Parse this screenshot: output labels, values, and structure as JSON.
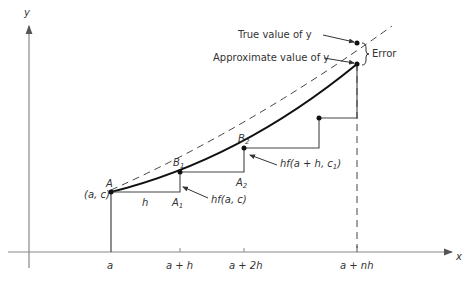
{
  "diagram": {
    "axes": {
      "x_label": "x",
      "y_label": "y"
    },
    "x_ticks": [
      "a",
      "a + h",
      "a + 2h",
      "a + nh"
    ],
    "points": {
      "A": "A",
      "A_coord": "(a, c)",
      "B1": "B",
      "B1_sub": "1",
      "B2": "B",
      "B2_sub": "2",
      "A1": "A",
      "A1_sub": "1",
      "A2": "A",
      "A2_sub": "2"
    },
    "labels": {
      "step": "h",
      "hf1": "hf(a, c)",
      "hf2_prefix": "hf(a + h, c",
      "hf2_sub": "1",
      "hf2_suffix": ")",
      "true_value": "True value of y",
      "approx_value": "Approximate value of y",
      "error": "Error"
    }
  }
}
